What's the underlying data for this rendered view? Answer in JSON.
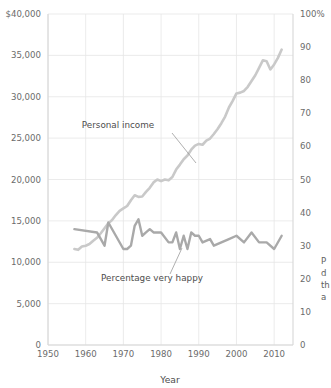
{
  "chart_data": {
    "type": "line",
    "title": "",
    "xlabel": "Year",
    "ylabel_left": "",
    "ylabel_right": "",
    "xlim": [
      1950,
      2015
    ],
    "grid": true,
    "legend": "annotations",
    "x_ticks": [
      "1950",
      "1960",
      "1970",
      "1980",
      "1990",
      "2000",
      "2010"
    ],
    "x_tick_values": [
      1950,
      1960,
      1970,
      1980,
      1990,
      2000,
      2010
    ],
    "y_left_ticks": [
      "0",
      "5,000",
      "10,000",
      "15,000",
      "20,000",
      "25,000",
      "30,000",
      "35,000",
      "$40,000"
    ],
    "y_left_values": [
      0,
      5000,
      10000,
      15000,
      20000,
      25000,
      30000,
      35000,
      40000
    ],
    "y_left_lim": [
      0,
      40000
    ],
    "y_right_ticks": [
      "0",
      "10",
      "20",
      "30",
      "40",
      "50",
      "60",
      "70",
      "80",
      "90",
      "100%"
    ],
    "y_right_values": [
      0,
      10,
      20,
      30,
      40,
      50,
      60,
      70,
      80,
      90,
      100
    ],
    "y_right_lim": [
      0,
      100
    ],
    "series": [
      {
        "name": "Personal income",
        "axis": "left",
        "color": "#c9c9c9",
        "x": [
          1957,
          1958,
          1959,
          1960,
          1961,
          1962,
          1963,
          1964,
          1965,
          1966,
          1967,
          1968,
          1969,
          1970,
          1971,
          1972,
          1973,
          1974,
          1975,
          1976,
          1977,
          1978,
          1979,
          1980,
          1981,
          1982,
          1983,
          1984,
          1985,
          1986,
          1987,
          1988,
          1989,
          1990,
          1991,
          1992,
          1993,
          1994,
          1995,
          1996,
          1997,
          1998,
          1999,
          2000,
          2001,
          2002,
          2003,
          2004,
          2005,
          2006,
          2007,
          2008,
          2009,
          2010,
          2011,
          2012
        ],
        "values": [
          11600,
          11500,
          11900,
          12000,
          12200,
          12600,
          12950,
          13500,
          14100,
          14700,
          15100,
          15700,
          16200,
          16500,
          16800,
          17500,
          18100,
          17900,
          17950,
          18500,
          19000,
          19650,
          20000,
          19800,
          20000,
          19900,
          20300,
          21200,
          21800,
          22450,
          22900,
          23600,
          24100,
          24300,
          24200,
          24700,
          24950,
          25500,
          26100,
          26800,
          27600,
          28700,
          29500,
          30400,
          30500,
          30700,
          31200,
          31900,
          32600,
          33500,
          34400,
          34300,
          33300,
          33900,
          34700,
          35700
        ],
        "label_note": "Personal income rises from about $11,600 in 1957 to about $36,000 by 2012 (left axis, US dollars)"
      },
      {
        "name": "Percentage very happy",
        "axis": "right",
        "color": "#a9a9a9",
        "x": [
          1957,
          1963,
          1965,
          1966,
          1970,
          1971,
          1972,
          1973,
          1974,
          1975,
          1976,
          1977,
          1978,
          1980,
          1982,
          1983,
          1984,
          1985,
          1986,
          1987,
          1988,
          1989,
          1990,
          1991,
          1993,
          1994,
          1996,
          1998,
          2000,
          2002,
          2004,
          2006,
          2008,
          2010,
          2012
        ],
        "values": [
          35,
          34,
          30,
          37,
          29,
          29,
          30,
          36,
          38,
          33,
          34,
          35,
          34,
          34,
          31,
          31,
          34,
          29,
          33,
          29,
          34,
          33,
          33,
          31,
          32,
          30,
          31,
          32,
          33,
          31,
          34,
          31,
          31,
          29,
          33
        ],
        "label_note": "Percentage very happy stays roughly flat near 30-35 percent (right axis)"
      }
    ],
    "annotations": [
      {
        "text": "Personal income",
        "x_px": 118,
        "y_px": 128
      },
      {
        "text": "Percentage very happy",
        "x_px": 152,
        "y_px": 281
      }
    ]
  },
  "axes": {
    "x_title": "Year",
    "left_unit_prefix": "$",
    "right_unit_suffix": "%"
  },
  "side_caption": {
    "line1": "P",
    "line2": "d",
    "line3": "th",
    "line4": "a"
  }
}
